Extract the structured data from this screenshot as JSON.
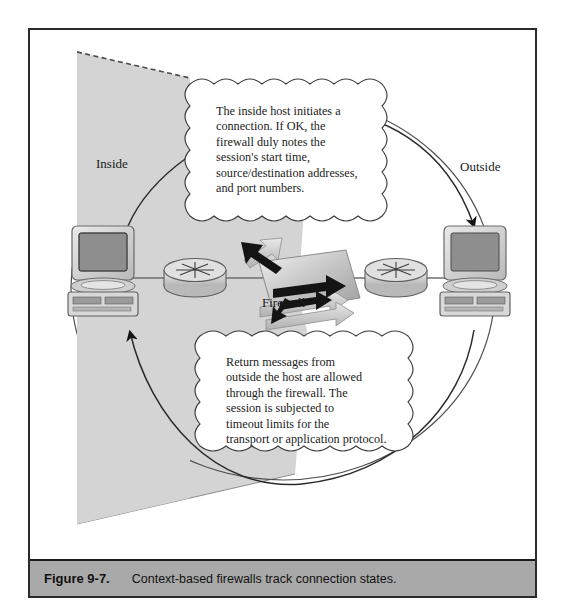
{
  "figure": {
    "caption_number": "Figure 9-7.",
    "caption_text": "Context-based firewalls track connection states."
  },
  "diagram": {
    "type": "network-security-diagram",
    "zones": [
      {
        "name": "inside-zone",
        "label": "Inside"
      },
      {
        "name": "outside-zone",
        "label": "Outside"
      }
    ],
    "device_label": "Firewall",
    "nodes": [
      {
        "name": "inside-host",
        "icon": "desktop-computer-icon"
      },
      {
        "name": "inside-router",
        "icon": "router-icon"
      },
      {
        "name": "firewall",
        "icon": "firewall-panel-icon"
      },
      {
        "name": "outside-router",
        "icon": "router-icon"
      },
      {
        "name": "outside-host",
        "icon": "desktop-computer-icon"
      }
    ],
    "flows": [
      {
        "name": "outbound-flow",
        "direction": "inside-to-outside"
      },
      {
        "name": "inbound-flow",
        "direction": "outside-to-inside"
      }
    ],
    "callouts": [
      {
        "name": "outbound-callout",
        "lines": [
          "The inside host initiates a",
          "connection. If OK, the",
          "firewall duly notes the",
          "session's start time,",
          "source/destination addresses,",
          "and port numbers."
        ]
      },
      {
        "name": "inbound-callout",
        "lines": [
          "Return messages from",
          "outside the host are allowed",
          "through the firewall. The",
          "session is subjected to",
          "timeout limits for the",
          "transport or application protocol."
        ]
      }
    ],
    "colors": {
      "zone_fill": "#d4d4d4",
      "caption_bar": "#a9a9a9",
      "frame_border": "#2b2b2b",
      "line": "#6d6d6d",
      "arrow": "#1a1a1a"
    }
  }
}
